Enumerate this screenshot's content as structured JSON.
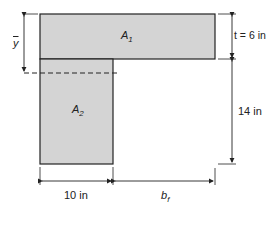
{
  "diagram": {
    "type": "T-beam cross-section",
    "fill_color": "#d4d4d4",
    "stroke_color": "#222222",
    "areas": [
      {
        "name": "A",
        "sub": "1"
      },
      {
        "name": "A",
        "sub": "2"
      }
    ],
    "dimensions": {
      "centroid_label": "y",
      "flange_thickness": "t = 6 in",
      "web_height": "14 in",
      "web_width": "10 in",
      "flange_overhang": "b",
      "flange_overhang_sub": "f"
    }
  }
}
